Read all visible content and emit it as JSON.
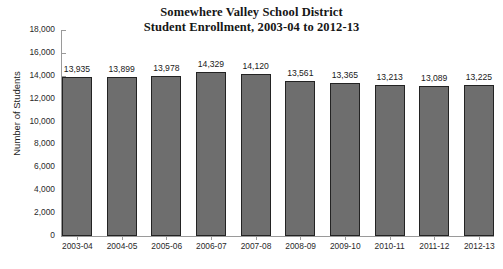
{
  "chart_data": {
    "type": "bar",
    "title": "Somewhere Valley School District\nStudent Enrollment, 2003-04 to 2012-13",
    "title_lines": [
      "Somewhere Valley School District",
      "Student Enrollment, 2003-04 to 2012-13"
    ],
    "xlabel": "",
    "ylabel": "Number of Students",
    "ylim": [
      0,
      18000
    ],
    "ytick_step": 2000,
    "ytick_labels": [
      "18,000",
      "16,000",
      "14,000",
      "12,000",
      "10,000",
      "8,000",
      "6,000",
      "4,000",
      "2,000",
      "0"
    ],
    "ytick_values": [
      18000,
      16000,
      14000,
      12000,
      10000,
      8000,
      6000,
      4000,
      2000,
      0
    ],
    "grid": false,
    "legend": false,
    "categories": [
      "2003-04",
      "2004-05",
      "2005-06",
      "2006-07",
      "2007-08",
      "2008-09",
      "2009-10",
      "2010-11",
      "2011-12",
      "2012-13"
    ],
    "values": [
      13935,
      13899,
      13978,
      14329,
      14120,
      13561,
      13365,
      13213,
      13089,
      13225
    ],
    "value_labels": [
      "13,935",
      "13,899",
      "13,978",
      "14,329",
      "14,120",
      "13,561",
      "13,365",
      "13,213",
      "13,089",
      "13,225"
    ],
    "bar_color": "#6e6e6e",
    "bar_border_color": "#232323",
    "axis_color": "#9a9a9a",
    "background": "#ffffff"
  }
}
